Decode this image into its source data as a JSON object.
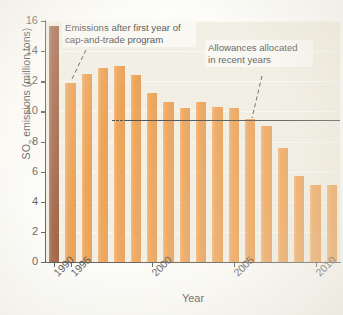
{
  "chart_data": {
    "type": "bar",
    "title": "",
    "xlabel": "Year",
    "ylabel": "SO2 emissions (million tons)",
    "ylabel_parts": {
      "pre": "SO",
      "sub": "2",
      "post": " emissions (million tons)"
    },
    "ylim": [
      0,
      16
    ],
    "yticks": [
      0,
      2,
      4,
      6,
      8,
      10,
      12,
      14,
      16
    ],
    "ytick_labels": [
      "0",
      "2",
      "4",
      "6",
      "8",
      "10",
      "12",
      "14",
      "16"
    ],
    "xtick_years": [
      1990,
      1995,
      2000,
      2005,
      2010
    ],
    "xtick_labels": [
      "1990",
      "1995",
      "2000",
      "2005",
      "2010"
    ],
    "grid": "horizontal-light",
    "legend_position": "none",
    "categories": [
      "1990",
      "1995",
      "1996",
      "1997",
      "1998",
      "1999",
      "2000",
      "2001",
      "2002",
      "2003",
      "2004",
      "2005",
      "2006",
      "2007",
      "2008",
      "2009",
      "2010",
      "2011"
    ],
    "values": [
      15.7,
      11.9,
      12.5,
      12.9,
      13.0,
      12.4,
      11.2,
      10.6,
      10.2,
      10.6,
      10.3,
      10.2,
      9.5,
      9.0,
      7.6,
      5.7,
      5.1,
      5.1
    ],
    "bar_colors": {
      "baseline": "#8c3a14",
      "post_program": "#ec8a28"
    },
    "baseline_category": "1990",
    "reference_line": {
      "label": "Allowances allocated",
      "value": 9.4,
      "style": "solid-with-dashed-lead",
      "x_start_year": 1999,
      "x_end_year": 2011
    },
    "annotations": [
      {
        "name": "cap-and-trade-note",
        "line1": "Emissions after first year of",
        "line2": "cap-and-trade program",
        "points_to": "1995"
      },
      {
        "name": "allowances-note",
        "line1": "Allowances allocated",
        "line2": "in recent years",
        "points_to": "reference-line"
      }
    ],
    "notes": {
      "plot_background": "#efebdf",
      "axis_color": "#2b2b2b"
    }
  }
}
